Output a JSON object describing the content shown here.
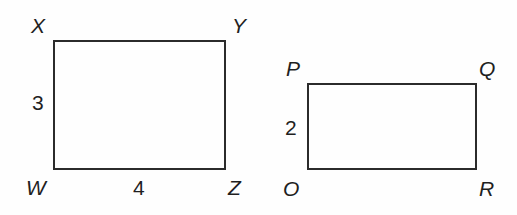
{
  "figure": {
    "background_color": "#fefefe",
    "stroke_color": "#2b2b2b",
    "text_color": "#1f1f1f"
  },
  "shapes": [
    {
      "id": "rectangle-wxyz",
      "name": "WXYZ",
      "vertices": [
        {
          "label": "X",
          "corner": "top-left"
        },
        {
          "label": "Y",
          "corner": "top-right"
        },
        {
          "label": "W",
          "corner": "bottom-left"
        },
        {
          "label": "Z",
          "corner": "bottom-right"
        }
      ],
      "side_labels": [
        {
          "label": "3",
          "side": "left",
          "meaning": "height"
        },
        {
          "label": "4",
          "side": "bottom",
          "meaning": "width"
        }
      ]
    },
    {
      "id": "rectangle-opqr",
      "name": "OPQR",
      "vertices": [
        {
          "label": "P",
          "corner": "top-left"
        },
        {
          "label": "Q",
          "corner": "top-right"
        },
        {
          "label": "O",
          "corner": "bottom-left"
        },
        {
          "label": "R",
          "corner": "bottom-right"
        }
      ],
      "side_labels": [
        {
          "label": "2",
          "side": "left",
          "meaning": "height"
        }
      ]
    }
  ]
}
